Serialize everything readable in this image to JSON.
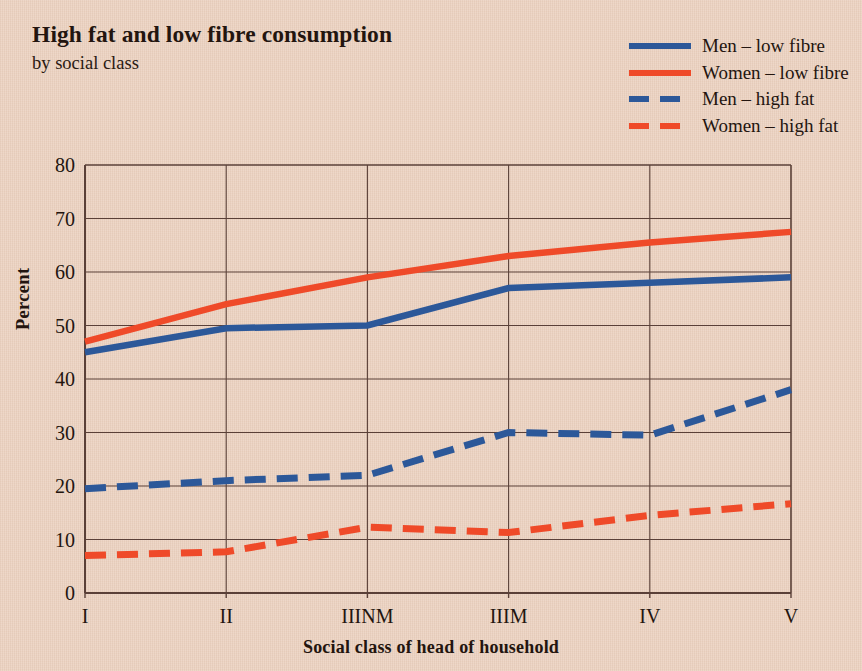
{
  "title": "High fat and low fibre consumption",
  "subtitle": "by social class",
  "legend": [
    {
      "label": "Men – low fibre",
      "style": "solid",
      "color": "#2c5899"
    },
    {
      "label": "Women – low fibre",
      "style": "solid",
      "color": "#ef4a29"
    },
    {
      "label": "Men – high fat",
      "style": "dashed",
      "color": "#2c5899"
    },
    {
      "label": "Women – high fat",
      "style": "dashed",
      "color": "#ef4a29"
    }
  ],
  "colors": {
    "background": "#ecd4c3",
    "blue": "#2c5899",
    "red": "#ef4a29",
    "axis": "#5a4038",
    "text": "#23150f"
  },
  "chart_data": {
    "type": "line",
    "title": "High fat and low fibre consumption",
    "subtitle": "by social class",
    "xlabel": "Social class of head of household",
    "ylabel": "Percent",
    "categories": [
      "I",
      "II",
      "IIINM",
      "IIIM",
      "IV",
      "V"
    ],
    "ylim": [
      0,
      80
    ],
    "yticks": [
      0,
      10,
      20,
      30,
      40,
      50,
      60,
      70,
      80
    ],
    "grid": true,
    "legend_position": "top-right",
    "series": [
      {
        "name": "Men – low fibre",
        "style": "solid",
        "color": "#2c5899",
        "values": [
          45,
          49.5,
          50,
          57,
          58,
          59
        ]
      },
      {
        "name": "Women – low fibre",
        "style": "solid",
        "color": "#ef4a29",
        "values": [
          47,
          54,
          59,
          63,
          65.5,
          67.5
        ]
      },
      {
        "name": "Men – high fat",
        "style": "dashed",
        "color": "#2c5899",
        "values": [
          19.5,
          21,
          22,
          30,
          29.5,
          38
        ]
      },
      {
        "name": "Women – high fat",
        "style": "dashed",
        "color": "#ef4a29",
        "values": [
          7,
          7.7,
          12.3,
          11.3,
          14.5,
          16.7
        ]
      }
    ]
  }
}
